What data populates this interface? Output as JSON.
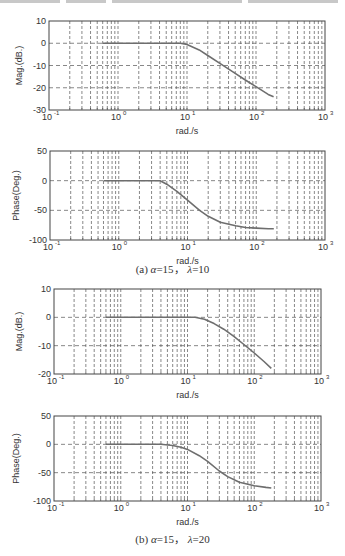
{
  "figure": {
    "top_strip_note": "clipped text from preceding line",
    "captions": [
      {
        "id": "a",
        "label": "(a)",
        "alpha": "α",
        "alpha_value": "=15，",
        "lambda": "λ",
        "lambda_value": "=10"
      },
      {
        "id": "b",
        "label": "(b)",
        "alpha": "α",
        "alpha_value": "=15，",
        "lambda": "λ",
        "lambda_value": "=20"
      }
    ]
  },
  "chart_data": [
    {
      "type": "line",
      "panel": "a-magnitude",
      "title": "",
      "xlabel": "rad./s",
      "ylabel": "Mag.(dB.)",
      "xscale": "log",
      "xlim": [
        0.1,
        1000
      ],
      "ylim": [
        -30,
        10
      ],
      "xticks": [
        0.1,
        1,
        10,
        100,
        1000
      ],
      "xtick_labels": [
        "10^-1",
        "10^0",
        "10^1",
        "10^2",
        "10^3"
      ],
      "yticks": [
        10,
        0,
        -10,
        -20,
        -30
      ],
      "ytick_labels": [
        "10",
        "0",
        "-10",
        "-20",
        "-30"
      ],
      "grid": true,
      "series": [
        {
          "name": "magnitude",
          "x": [
            0.6,
            1,
            2,
            5,
            8,
            10,
            15,
            20,
            30,
            50,
            70,
            100,
            150,
            180
          ],
          "y": [
            0,
            0,
            0,
            0,
            0,
            -0.5,
            -3,
            -5.5,
            -9,
            -13.5,
            -16.5,
            -19.5,
            -23,
            -24
          ]
        }
      ]
    },
    {
      "type": "line",
      "panel": "a-phase",
      "title": "",
      "xlabel": "rad./s",
      "ylabel": "Phase(Deg.)",
      "xscale": "log",
      "xlim": [
        0.1,
        1000
      ],
      "ylim": [
        -100,
        50
      ],
      "xticks": [
        0.1,
        1,
        10,
        100,
        1000
      ],
      "xtick_labels": [
        "10^-1",
        "10^0",
        "10^1",
        "10^2",
        "10^3"
      ],
      "yticks": [
        50,
        0,
        -50,
        -100
      ],
      "ytick_labels": [
        "50",
        "0",
        "-50",
        "-100"
      ],
      "grid": true,
      "series": [
        {
          "name": "phase",
          "x": [
            0.6,
            1,
            2,
            3,
            4,
            5,
            7,
            10,
            15,
            20,
            30,
            50,
            70,
            100,
            150,
            180
          ],
          "y": [
            0,
            0,
            0,
            0,
            0,
            -6,
            -18,
            -33,
            -50,
            -60,
            -70,
            -76,
            -79,
            -80,
            -81,
            -81
          ]
        }
      ]
    },
    {
      "type": "line",
      "panel": "b-magnitude",
      "title": "",
      "xlabel": "rad./s",
      "ylabel": "Mag.(dB.)",
      "xscale": "log",
      "xlim": [
        0.1,
        1000
      ],
      "ylim": [
        -20,
        10
      ],
      "xticks": [
        0.1,
        1,
        10,
        100,
        1000
      ],
      "xtick_labels": [
        "10^-1",
        "10^0",
        "10^1",
        "10^2",
        "10^3"
      ],
      "yticks": [
        10,
        0,
        -10,
        -20
      ],
      "ytick_labels": [
        "10",
        "0",
        "-10",
        "-20"
      ],
      "grid": true,
      "series": [
        {
          "name": "magnitude",
          "x": [
            0.6,
            1,
            2,
            5,
            10,
            13,
            18,
            25,
            35,
            50,
            70,
            100,
            140,
            180
          ],
          "y": [
            0,
            0,
            0,
            0,
            0,
            0,
            -0.7,
            -2.2,
            -4.2,
            -6.8,
            -9.6,
            -12.6,
            -15.6,
            -18
          ]
        }
      ]
    },
    {
      "type": "line",
      "panel": "b-phase",
      "title": "",
      "xlabel": "rad./s",
      "ylabel": "Phase(Deg.)",
      "xscale": "log",
      "xlim": [
        0.1,
        1000
      ],
      "ylim": [
        -100,
        50
      ],
      "xticks": [
        0.1,
        1,
        10,
        100,
        1000
      ],
      "xtick_labels": [
        "10^-1",
        "10^0",
        "10^1",
        "10^2",
        "10^3"
      ],
      "yticks": [
        50,
        0,
        -50,
        -100
      ],
      "ytick_labels": [
        "50",
        "0",
        "-50",
        "-100"
      ],
      "grid": true,
      "series": [
        {
          "name": "phase",
          "x": [
            0.6,
            1,
            2,
            4,
            6,
            8,
            10,
            15,
            20,
            30,
            40,
            60,
            100,
            150,
            180
          ],
          "y": [
            0,
            0,
            0,
            0,
            -2,
            -5,
            -9,
            -20,
            -30,
            -47,
            -57,
            -67,
            -73,
            -76,
            -77
          ]
        }
      ]
    }
  ],
  "layout": {
    "panels": [
      {
        "left": 49,
        "top": 21,
        "right": 325,
        "bottom": 110,
        "tick_y": 117,
        "xlabel_y": 131
      },
      {
        "left": 50,
        "top": 151,
        "right": 325,
        "bottom": 240,
        "tick_y": 247,
        "xlabel_y": 261
      },
      {
        "left": 54,
        "top": 289,
        "right": 321,
        "bottom": 374,
        "tick_y": 381,
        "xlabel_y": 395
      },
      {
        "left": 54,
        "top": 416,
        "right": 321,
        "bottom": 501,
        "tick_y": 508,
        "xlabel_y": 522
      }
    ],
    "caption_y": [
      267,
      537
    ],
    "colors": {
      "axis": "#444444",
      "grid": "#555555",
      "curve": "#6e6e6e",
      "text": "#333333"
    }
  }
}
